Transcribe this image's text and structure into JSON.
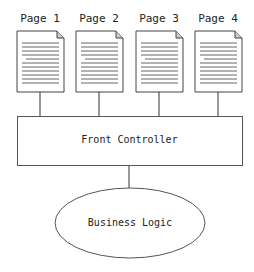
{
  "diagram": {
    "pages": [
      {
        "label": "Page 1"
      },
      {
        "label": "Page 2"
      },
      {
        "label": "Page 3"
      },
      {
        "label": "Page 4"
      }
    ],
    "controller": {
      "label": "Front Controller"
    },
    "business": {
      "label": "Business Logic"
    },
    "colors": {
      "stroke": "#333333",
      "lines": "#555555",
      "background": "#ffffff"
    }
  }
}
